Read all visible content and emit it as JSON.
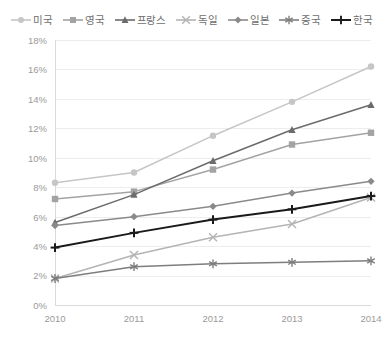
{
  "chart_data": {
    "type": "line",
    "title": "",
    "xlabel": "",
    "ylabel": "",
    "x": [
      "2010",
      "2011",
      "2012",
      "2013",
      "2014"
    ],
    "categories": [
      "2010",
      "2011",
      "2012",
      "2013",
      "2014"
    ],
    "ylim": [
      0,
      18
    ],
    "ytick_labels": [
      "0%",
      "2%",
      "4%",
      "6%",
      "8%",
      "10%",
      "12%",
      "14%",
      "16%",
      "18%"
    ],
    "ytick_values": [
      0,
      2,
      4,
      6,
      8,
      10,
      12,
      14,
      16,
      18
    ],
    "grid": true,
    "legend_position": "top",
    "series": [
      {
        "name": "미국",
        "marker": "circle",
        "color": "#c6c6c6",
        "values": [
          8.3,
          9.0,
          11.5,
          13.8,
          16.2
        ]
      },
      {
        "name": "영국",
        "marker": "square",
        "color": "#a3a3a3",
        "values": [
          7.2,
          7.7,
          9.2,
          10.9,
          11.7
        ]
      },
      {
        "name": "프랑스",
        "marker": "triangle",
        "color": "#6b6b6b",
        "values": [
          5.6,
          7.5,
          9.8,
          11.9,
          13.6
        ]
      },
      {
        "name": "독일",
        "marker": "x",
        "color": "#b4b4b4",
        "values": [
          1.8,
          3.4,
          4.6,
          5.5,
          7.3
        ]
      },
      {
        "name": "일본",
        "marker": "diamond",
        "color": "#8a8a8a",
        "values": [
          5.4,
          6.0,
          6.7,
          7.6,
          8.4
        ]
      },
      {
        "name": "중국",
        "marker": "asterisk",
        "color": "#7e7e7e",
        "values": [
          1.8,
          2.6,
          2.8,
          2.9,
          3.0
        ]
      },
      {
        "name": "한국",
        "marker": "plus",
        "color": "#1a1a1a",
        "values": [
          3.9,
          4.9,
          5.8,
          6.5,
          7.4
        ]
      }
    ]
  },
  "legend": {
    "items": [
      {
        "label": "미국"
      },
      {
        "label": "영국"
      },
      {
        "label": "프랑스"
      },
      {
        "label": "독일"
      },
      {
        "label": "일본"
      },
      {
        "label": "중국"
      },
      {
        "label": "한국"
      }
    ]
  }
}
